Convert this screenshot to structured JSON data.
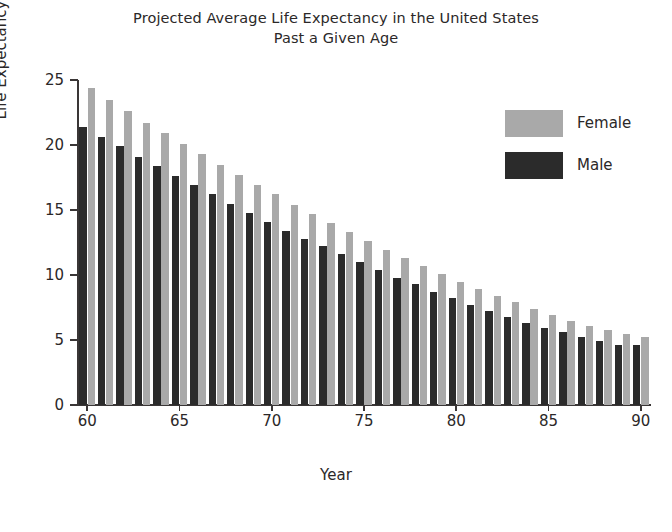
{
  "chart": {
    "title_line1": "Projected Average Life Expectancy in the United States",
    "title_line2": "Past a Given Age",
    "axis_title_y": "Life Expectancy",
    "axis_title_x": "Year"
  },
  "legend": {
    "position": "top-right",
    "items": [
      {
        "label": "Female",
        "color": "#a9a9a9"
      },
      {
        "label": "Male",
        "color": "#2b2b2b"
      }
    ]
  },
  "chart_data": {
    "type": "bar",
    "title": "Projected Average Life Expectancy in the United States Past a Given Age",
    "xlabel": "Year",
    "ylabel": "Life Expectancy",
    "xlim": [
      60,
      90
    ],
    "ylim": [
      0,
      25
    ],
    "ytick_labels": [
      "0",
      "5",
      "10",
      "15",
      "20",
      "25"
    ],
    "yticks": [
      0,
      5,
      10,
      15,
      20,
      25
    ],
    "xtick_labels": [
      "60",
      "65",
      "70",
      "75",
      "80",
      "85",
      "90"
    ],
    "xticks": [
      60,
      65,
      70,
      75,
      80,
      85,
      90
    ],
    "grid": false,
    "categories": [
      60,
      61,
      62,
      63,
      64,
      65,
      66,
      67,
      68,
      69,
      70,
      71,
      72,
      73,
      74,
      75,
      76,
      77,
      78,
      79,
      80,
      81,
      82,
      83,
      84,
      85,
      86,
      87,
      88,
      89,
      90
    ],
    "series": [
      {
        "name": "Female",
        "color": "#a9a9a9",
        "values": [
          24.4,
          23.5,
          22.6,
          21.7,
          20.9,
          20.1,
          19.3,
          18.5,
          17.7,
          16.9,
          16.2,
          15.4,
          14.7,
          14.0,
          13.3,
          12.6,
          11.9,
          11.3,
          10.7,
          10.1,
          9.5,
          8.9,
          8.4,
          7.9,
          7.4,
          6.9,
          6.5,
          6.1,
          5.8,
          5.5,
          5.2
        ]
      },
      {
        "name": "Male",
        "color": "#2b2b2b",
        "values": [
          21.4,
          20.6,
          19.9,
          19.1,
          18.4,
          17.6,
          16.9,
          16.2,
          15.5,
          14.8,
          14.1,
          13.4,
          12.8,
          12.2,
          11.6,
          11.0,
          10.4,
          9.8,
          9.3,
          8.7,
          8.2,
          7.7,
          7.2,
          6.8,
          6.3,
          5.9,
          5.6,
          5.2,
          4.9,
          4.6,
          4.6
        ]
      }
    ]
  }
}
